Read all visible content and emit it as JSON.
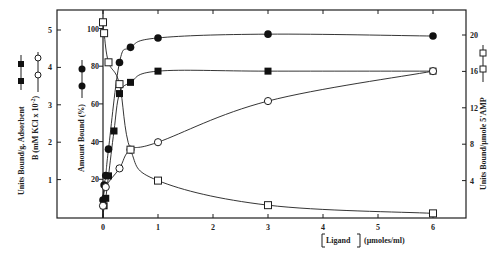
{
  "chart_data": {
    "type": "line",
    "title": "",
    "xlabel": "[Ligand] (µmoles/ml)",
    "x_ticks": [
      "0",
      "1",
      "2",
      "3",
      "4",
      "5",
      "6"
    ],
    "xlim": [
      -0.6,
      6.4
    ],
    "axes": {
      "left_outer": {
        "label_line1": "Units Bound/g. Adsorbent",
        "label_line2": "B (mM KCl x 10^-2)",
        "ticks": [
          "1",
          "2",
          "3",
          "4",
          "5"
        ],
        "ylim": [
          0,
          5.5
        ]
      },
      "left_inner": {
        "label": "Amount Bound (%)",
        "ticks": [
          "20",
          "40",
          "60",
          "80",
          "100"
        ],
        "ylim": [
          0,
          105
        ]
      },
      "right": {
        "label": "Units Bound/µmole 5'AMP",
        "ticks": [
          "4",
          "8",
          "12",
          "16",
          "20"
        ],
        "ylim": [
          0,
          22
        ]
      }
    },
    "series": [
      {
        "name": "Amount Bound (%)",
        "marker": "filled-circle",
        "axis": "left_inner",
        "x": [
          0,
          0.02,
          0.05,
          0.1,
          0.3,
          0.5,
          1,
          3,
          6
        ],
        "y": [
          9,
          17,
          22,
          36,
          82,
          90,
          95,
          97,
          96
        ]
      },
      {
        "name": "Units Bound/g. Adsorbent",
        "marker": "filled-square",
        "axis": "left_outer",
        "x": [
          0.02,
          0.05,
          0.1,
          0.2,
          0.3,
          0.5,
          1,
          3,
          6
        ],
        "y": [
          0.3,
          0.5,
          1.1,
          2.3,
          3.3,
          3.6,
          3.9,
          3.9,
          3.9
        ]
      },
      {
        "name": "B (mM KCl x 10^-2)",
        "marker": "open-circle",
        "axis": "left_outer",
        "x": [
          0,
          0.05,
          0.3,
          0.5,
          1,
          3,
          6
        ],
        "y": [
          0.3,
          0.8,
          1.3,
          1.8,
          2.0,
          3.1,
          3.9
        ]
      },
      {
        "name": "Units Bound/µmole 5'AMP",
        "marker": "open-square",
        "axis": "right",
        "x": [
          0,
          0.02,
          0.1,
          0.3,
          0.5,
          1,
          3,
          6
        ],
        "y": [
          21.4,
          20.2,
          17.0,
          14.6,
          7.4,
          4.0,
          1.3,
          0.4
        ]
      }
    ],
    "grid": false,
    "legend_position": "inline with axis labels (marker symbols beside axis titles)"
  },
  "labels": {
    "xlabel_bracket": "Ligand",
    "xlabel_units": "(µmoles/ml)",
    "left_outer_line1": "Units  Bound/g. Adsorbent",
    "left_outer_line2": "B (mM KCl x 10",
    "left_outer_line2_sup": "-2",
    "left_outer_line2_end": ")",
    "left_inner": "Amount  Bound (%)",
    "right": "Units  Bound/µmole  5'AMP"
  }
}
